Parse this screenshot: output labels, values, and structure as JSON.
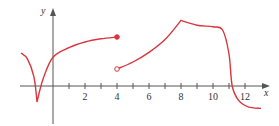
{
  "chart_data": {
    "type": "line",
    "title": "",
    "xlabel": "x",
    "ylabel": "y",
    "xlim": [
      -2.2,
      13.5
    ],
    "ylim": [
      -2.5,
      5
    ],
    "x_ticks": [
      1,
      2,
      3,
      4,
      5,
      6,
      7,
      8,
      9,
      10,
      11,
      12
    ],
    "x_tick_labels": [
      "2",
      "4",
      "6",
      "8",
      "10",
      "12"
    ],
    "x_tick_label_values": [
      2,
      4,
      6,
      8,
      10,
      12
    ],
    "grid": false,
    "legend": null,
    "colors": {
      "curve": "#d9363e",
      "axis": "#555555"
    },
    "series": [
      {
        "name": "piece 1 (cusp)",
        "description": "starts near (-2,2.1), falls to a cusp at (-1,-1), rises concave-down to a filled dot at (4,3.1)",
        "points": [
          [
            -2,
            2.06
          ],
          [
            -1.6,
            1.7
          ],
          [
            -1.2,
            0.6
          ],
          [
            -1,
            -1
          ],
          [
            -0.6,
            0.5
          ],
          [
            0,
            1.8
          ],
          [
            1,
            2.4
          ],
          [
            2,
            2.75
          ],
          [
            3,
            2.95
          ],
          [
            4,
            3.06
          ]
        ],
        "end_marker": {
          "x": 4,
          "y": 3.06,
          "type": "filled"
        }
      },
      {
        "name": "piece 2",
        "description": "open circle at (4,1.06), rises concave-up to a corner at (8,4.1), flattens to about (10.3,3.7), then drops steeply near x=11.2 to about (13,-1.4)",
        "points": [
          [
            4,
            1.06
          ],
          [
            5,
            1.5
          ],
          [
            6,
            2.1
          ],
          [
            7,
            2.9
          ],
          [
            8,
            4.1
          ],
          [
            9,
            3.8
          ],
          [
            10,
            3.7
          ],
          [
            10.6,
            3.5
          ],
          [
            11,
            2
          ],
          [
            11.2,
            0
          ],
          [
            11.6,
            -0.9
          ],
          [
            12.2,
            -1.3
          ],
          [
            13,
            -1.4
          ]
        ],
        "start_marker": {
          "x": 4,
          "y": 1.06,
          "type": "open"
        }
      }
    ]
  }
}
